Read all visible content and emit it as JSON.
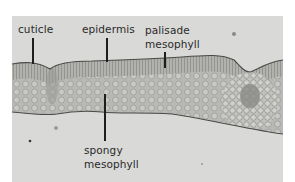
{
  "figure": {
    "colors": {
      "page_background": "#ffffff",
      "photo_background": "#d9d9d7",
      "tissue": "#a9a9a6",
      "label_text": "#2a2a2a"
    },
    "labels": [
      {
        "id": "cuticle",
        "lines": [
          "cuticle"
        ]
      },
      {
        "id": "epidermis",
        "lines": [
          "epidermis"
        ]
      },
      {
        "id": "palisade-mesophyll",
        "lines": [
          "palisade",
          "mesophyll"
        ]
      },
      {
        "id": "spongy-mesophyll",
        "lines": [
          "spongy",
          "mesophyll"
        ]
      }
    ]
  }
}
